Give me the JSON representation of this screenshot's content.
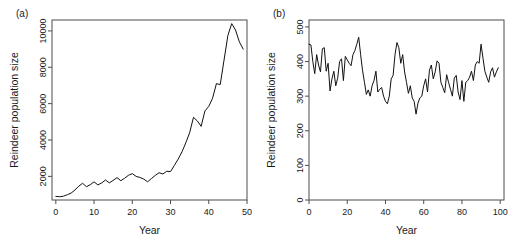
{
  "figure": {
    "panel_a_label": "(a)",
    "panel_b_label": "(b)"
  },
  "chart_data": [
    {
      "type": "line",
      "panel": "(a)",
      "title": "",
      "xlabel": "Year",
      "ylabel": "Reindeer population size",
      "xlim": [
        -1,
        50
      ],
      "ylim": [
        700,
        10600
      ],
      "xticks": [
        0,
        10,
        20,
        30,
        40,
        50
      ],
      "yticks": [
        2000,
        4000,
        6000,
        8000,
        10000
      ],
      "xtick_labels": [
        "0",
        "10",
        "20",
        "30",
        "40",
        "50"
      ],
      "ytick_labels": [
        "2000",
        "4000",
        "6000",
        "8000",
        "10000"
      ],
      "grid": false,
      "legend": "none",
      "line_color": "#111111",
      "x": [
        0,
        1,
        2,
        3,
        4,
        5,
        6,
        7,
        8,
        9,
        10,
        11,
        12,
        13,
        14,
        15,
        16,
        17,
        18,
        19,
        20,
        21,
        22,
        23,
        24,
        25,
        26,
        27,
        28,
        29,
        30,
        31,
        32,
        33,
        34,
        35,
        36,
        37,
        38,
        39,
        40,
        41,
        42,
        43,
        44,
        45,
        46,
        47,
        48,
        49
      ],
      "y": [
        900,
        880,
        910,
        990,
        1080,
        1250,
        1460,
        1620,
        1430,
        1540,
        1700,
        1530,
        1640,
        1800,
        1640,
        1780,
        1930,
        1760,
        1900,
        2060,
        2150,
        2000,
        1940,
        1850,
        1700,
        1880,
        2050,
        2200,
        2130,
        2280,
        2260,
        2600,
        2950,
        3350,
        3850,
        4400,
        5250,
        5050,
        4750,
        5600,
        5850,
        6300,
        7100,
        7050,
        8400,
        9750,
        10400,
        10050,
        9400,
        9000
      ]
    },
    {
      "type": "line",
      "panel": "(b)",
      "title": "",
      "xlabel": "Year",
      "ylabel": "Reindeer population size",
      "xlim": [
        0,
        102
      ],
      "ylim": [
        0,
        520
      ],
      "xticks": [
        0,
        20,
        40,
        60,
        80,
        100
      ],
      "yticks": [
        0,
        100,
        200,
        300,
        400,
        500
      ],
      "xtick_labels": [
        "0",
        "20",
        "40",
        "60",
        "80",
        "100"
      ],
      "ytick_labels": [
        "0",
        "100",
        "200",
        "300",
        "400",
        "500"
      ],
      "grid": false,
      "legend": "none",
      "line_color": "#111111",
      "x": [
        0,
        1,
        2,
        3,
        4,
        5,
        6,
        7,
        8,
        9,
        10,
        11,
        12,
        13,
        14,
        15,
        16,
        17,
        18,
        19,
        20,
        21,
        22,
        23,
        24,
        25,
        26,
        27,
        28,
        29,
        30,
        31,
        32,
        33,
        34,
        35,
        36,
        37,
        38,
        39,
        40,
        41,
        42,
        43,
        44,
        45,
        46,
        47,
        48,
        49,
        50,
        51,
        52,
        53,
        54,
        55,
        56,
        57,
        58,
        59,
        60,
        61,
        62,
        63,
        64,
        65,
        66,
        67,
        68,
        69,
        70,
        71,
        72,
        73,
        74,
        75,
        76,
        77,
        78,
        79,
        80,
        81,
        82,
        83,
        84,
        85,
        86,
        87,
        88,
        89,
        90,
        91,
        92,
        93,
        94,
        95,
        96,
        97,
        98,
        99
      ],
      "y": [
        450,
        448,
        400,
        365,
        420,
        390,
        370,
        437,
        440,
        372,
        395,
        315,
        350,
        372,
        330,
        352,
        400,
        408,
        345,
        415,
        405,
        395,
        388,
        420,
        432,
        450,
        470,
        420,
        375,
        340,
        305,
        318,
        300,
        330,
        345,
        372,
        312,
        320,
        325,
        300,
        285,
        278,
        300,
        350,
        360,
        420,
        455,
        440,
        395,
        420,
        370,
        340,
        308,
        330,
        295,
        285,
        248,
        280,
        295,
        300,
        330,
        350,
        312,
        375,
        390,
        350,
        370,
        402,
        395,
        340,
        325,
        310,
        362,
        340,
        320,
        300,
        352,
        360,
        312,
        290,
        345,
        285,
        340,
        345,
        355,
        372,
        345,
        390,
        400,
        395,
        450,
        410,
        372,
        355,
        340,
        370,
        382,
        355,
        370,
        382
      ]
    }
  ]
}
